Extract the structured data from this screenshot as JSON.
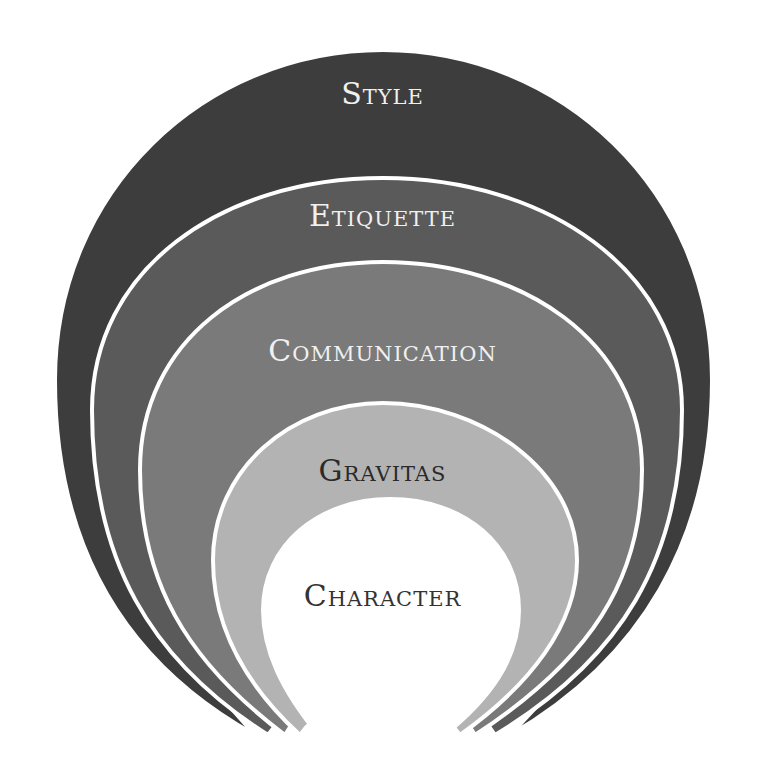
{
  "diagram": {
    "type": "nested-concentric-layers",
    "layers": [
      {
        "label": "Style",
        "fill": "#3d3d3d",
        "text_color": "#f0f0f0"
      },
      {
        "label": "Etiquette",
        "fill": "#5a5a5a",
        "text_color": "#f0f0f0"
      },
      {
        "label": "Communication",
        "fill": "#7a7a7a",
        "text_color": "#f0f0f0"
      },
      {
        "label": "Gravitas",
        "fill": "#b3b3b3",
        "text_color": "#2a2a2a"
      },
      {
        "label": "Character",
        "fill": "#ffffff",
        "text_color": "#333333"
      }
    ],
    "separator_color": "#ffffff"
  }
}
